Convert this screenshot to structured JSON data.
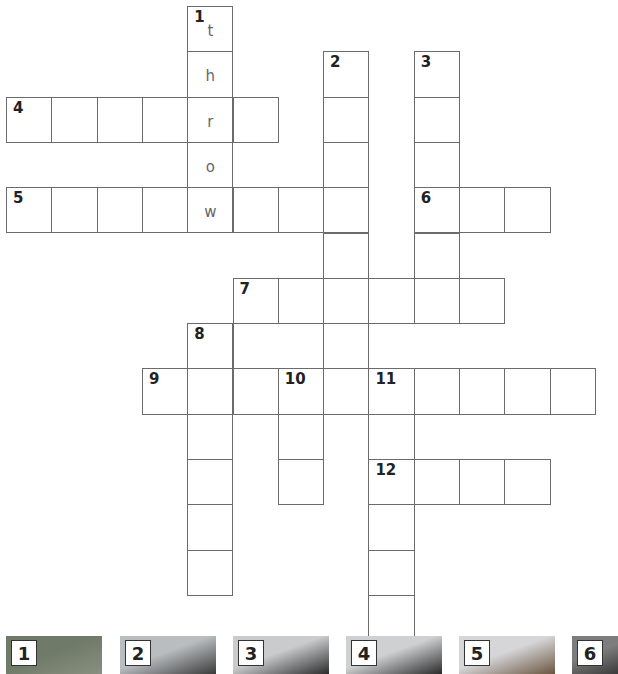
{
  "puzzle": {
    "cell_size": 45.3,
    "origin": {
      "x": 6,
      "y": 6
    },
    "clue_numbers": [
      {
        "n": "1",
        "row": 0,
        "col": 4
      },
      {
        "n": "2",
        "row": 1,
        "col": 7
      },
      {
        "n": "3",
        "row": 1,
        "col": 9
      },
      {
        "n": "4",
        "row": 2,
        "col": 0
      },
      {
        "n": "5",
        "row": 4,
        "col": 0
      },
      {
        "n": "6",
        "row": 4,
        "col": 9
      },
      {
        "n": "7",
        "row": 6,
        "col": 5
      },
      {
        "n": "8",
        "row": 7,
        "col": 4
      },
      {
        "n": "9",
        "row": 8,
        "col": 3
      },
      {
        "n": "10",
        "row": 8,
        "col": 6
      },
      {
        "n": "11",
        "row": 8,
        "col": 8
      },
      {
        "n": "12",
        "row": 10,
        "col": 8
      }
    ],
    "words": [
      {
        "n": "1",
        "dir": "down",
        "row": 0,
        "col": 4,
        "len": 5,
        "letters": [
          "t",
          "h",
          "r",
          "o",
          "w"
        ]
      },
      {
        "n": "2",
        "dir": "down",
        "row": 1,
        "col": 7,
        "len": 8
      },
      {
        "n": "3",
        "dir": "down",
        "row": 1,
        "col": 9,
        "len": 6
      },
      {
        "n": "4",
        "dir": "across",
        "row": 2,
        "col": 0,
        "len": 6
      },
      {
        "n": "5",
        "dir": "across",
        "row": 4,
        "col": 0,
        "len": 8
      },
      {
        "n": "6",
        "dir": "across",
        "row": 4,
        "col": 9,
        "len": 3
      },
      {
        "n": "7",
        "dir": "across",
        "row": 6,
        "col": 5,
        "len": 6
      },
      {
        "n": "8",
        "dir": "down",
        "row": 7,
        "col": 4,
        "len": 6
      },
      {
        "n": "9",
        "dir": "across",
        "row": 8,
        "col": 3,
        "len": 10
      },
      {
        "n": "10",
        "dir": "down",
        "row": 8,
        "col": 6,
        "len": 3
      },
      {
        "n": "11",
        "dir": "down",
        "row": 8,
        "col": 8,
        "len": 6
      },
      {
        "n": "12",
        "dir": "across",
        "row": 10,
        "col": 8,
        "len": 4
      }
    ],
    "extra_boxes": [
      {
        "row": 7,
        "col": 5,
        "width_cells": 2
      }
    ]
  },
  "picture_clues": [
    {
      "n": "1",
      "x": 6,
      "w": 96,
      "desc": "ball in air over field",
      "colors": [
        "#6f7a68",
        "#8a8f80"
      ]
    },
    {
      "n": "2",
      "x": 120,
      "w": 96,
      "desc": "grid of photos",
      "colors": [
        "#b9bdbf",
        "#3a3a3a"
      ]
    },
    {
      "n": "3",
      "x": 233,
      "w": 96,
      "desc": "shiny metal object",
      "colors": [
        "#c9cbcd",
        "#2b2b2b"
      ]
    },
    {
      "n": "4",
      "x": 346,
      "w": 96,
      "desc": "camera",
      "colors": [
        "#cfd0d2",
        "#2a2a2a"
      ]
    },
    {
      "n": "5",
      "x": 459,
      "w": 96,
      "desc": "girl with glasses",
      "colors": [
        "#d6d6d8",
        "#6a5540"
      ]
    },
    {
      "n": "6",
      "x": 572,
      "w": 46,
      "desc": "partial image",
      "colors": [
        "#7d7d7d",
        "#3a3a3a"
      ]
    }
  ]
}
